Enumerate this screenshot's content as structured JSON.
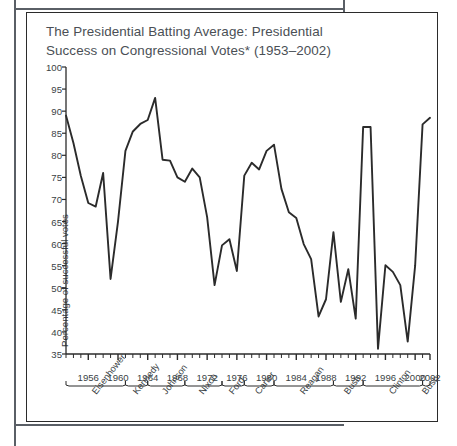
{
  "figure": {
    "title": "The Presidential Batting Average: Presidential Success on Congressional Votes* (1953–2002)",
    "title_line1": "The Presidential Batting Average: Presidential",
    "title_line2": "Success on Congressional Votes* (1953–2002)",
    "line_color": "#2b2b2b",
    "axis_color": "#2b2b2b",
    "text_color": "#3a3f45",
    "title_color": "#4a4f55",
    "frame_color": "#2b2b2b"
  },
  "chart_data": {
    "type": "line",
    "title": "The Presidential Batting Average: Presidential Success on Congressional Votes* (1953–2002)",
    "xlabel": "",
    "ylabel": "Percentage of successful votes",
    "xlim": [
      1953,
      2002
    ],
    "ylim": [
      35,
      100
    ],
    "ytick_step": 5,
    "yticks": [
      35,
      40,
      45,
      50,
      55,
      60,
      65,
      70,
      75,
      80,
      85,
      90,
      95,
      100
    ],
    "xticks": [
      1956,
      1960,
      1964,
      1968,
      1972,
      1976,
      1980,
      1984,
      1988,
      1992,
      1996,
      2000,
      2002
    ],
    "xtick_minor_step": 1,
    "grid": false,
    "legend": "none",
    "footnote_marker": "*",
    "x": [
      1953,
      1954,
      1955,
      1956,
      1957,
      1958,
      1959,
      1960,
      1961,
      1962,
      1963,
      1964,
      1965,
      1966,
      1967,
      1968,
      1969,
      1970,
      1971,
      1972,
      1973,
      1974,
      1975,
      1976,
      1977,
      1978,
      1979,
      1980,
      1981,
      1982,
      1983,
      1984,
      1985,
      1986,
      1987,
      1988,
      1989,
      1990,
      1991,
      1992,
      1993,
      1994,
      1995,
      1996,
      1997,
      1998,
      1999,
      2000,
      2001,
      2002
    ],
    "values": [
      89.0,
      82.8,
      75.3,
      69.2,
      68.4,
      76.0,
      52.0,
      65.0,
      81.0,
      85.4,
      87.1,
      88.0,
      93.0,
      79.0,
      78.8,
      75.0,
      74.0,
      77.0,
      75.0,
      66.0,
      50.6,
      59.6,
      61.0,
      53.8,
      75.4,
      78.3,
      76.8,
      81.0,
      82.4,
      72.4,
      67.1,
      65.8,
      59.9,
      56.5,
      43.5,
      47.4,
      62.6,
      46.8,
      54.2,
      43.0,
      86.4,
      86.4,
      36.2,
      55.1,
      53.6,
      50.6,
      37.8,
      55.0,
      87.0,
      88.5
    ],
    "series_name": "Presidential success on congressional votes",
    "annotations": []
  },
  "presidents": [
    {
      "name": "Eisenhower",
      "start": 1953,
      "end": 1961
    },
    {
      "name": "Kennedy",
      "start": 1961,
      "end": 1964
    },
    {
      "name": "Johnson",
      "start": 1964,
      "end": 1969
    },
    {
      "name": "Nixon",
      "start": 1969,
      "end": 1974
    },
    {
      "name": "Ford",
      "start": 1974,
      "end": 1977
    },
    {
      "name": "Carter",
      "start": 1977,
      "end": 1981
    },
    {
      "name": "Reagan",
      "start": 1981,
      "end": 1989
    },
    {
      "name": "Bush",
      "start": 1989,
      "end": 1993
    },
    {
      "name": "Clinton",
      "start": 1993,
      "end": 2001
    },
    {
      "name": "Bush",
      "start": 2001,
      "end": 2002
    }
  ]
}
